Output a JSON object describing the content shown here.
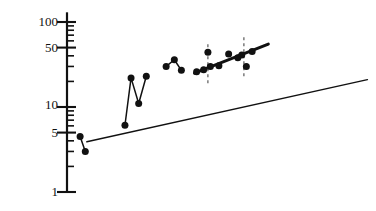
{
  "chart_data": {
    "type": "scatter",
    "title": "",
    "xlabel": "",
    "ylabel": "",
    "yscale": "log",
    "xscale": "linear",
    "grid": false,
    "legend": null,
    "ylim": [
      1,
      130
    ],
    "xlim": [
      0,
      1
    ],
    "y_ticks_major": [
      1,
      5,
      10,
      50,
      100
    ],
    "y_tick_labels": [
      "1",
      "5",
      "10",
      "50",
      "100"
    ],
    "y_ticks_minor": [
      2,
      3,
      4,
      6,
      7,
      8,
      9,
      20,
      30,
      40,
      60,
      70,
      80,
      90
    ],
    "x_axis_visible": false,
    "series": [
      {
        "name": "near-axis-pair",
        "style": "line-with-markers",
        "marker": "filled-circle",
        "points": [
          {
            "x": 0.043,
            "y": 4.5
          },
          {
            "x": 0.06,
            "y": 3.0
          }
        ]
      },
      {
        "name": "zigzag-series",
        "style": "line-with-markers",
        "marker": "filled-circle",
        "points": [
          {
            "x": 0.19,
            "y": 6.1
          },
          {
            "x": 0.21,
            "y": 22.0
          },
          {
            "x": 0.235,
            "y": 11.0
          },
          {
            "x": 0.26,
            "y": 23.0
          }
        ]
      },
      {
        "name": "peak-series",
        "style": "line-with-markers",
        "marker": "filled-circle",
        "points": [
          {
            "x": 0.325,
            "y": 30.0
          },
          {
            "x": 0.352,
            "y": 36.0
          },
          {
            "x": 0.375,
            "y": 27.0
          }
        ]
      },
      {
        "name": "main-cluster",
        "style": "markers-only",
        "marker": "filled-circle",
        "points": [
          {
            "x": 0.425,
            "y": 26.0
          },
          {
            "x": 0.448,
            "y": 27.5
          },
          {
            "x": 0.462,
            "y": 44.0
          },
          {
            "x": 0.47,
            "y": 30.0
          },
          {
            "x": 0.498,
            "y": 30.5
          },
          {
            "x": 0.53,
            "y": 42.0
          },
          {
            "x": 0.56,
            "y": 38.0
          },
          {
            "x": 0.573,
            "y": 41.0
          },
          {
            "x": 0.588,
            "y": 30.0
          },
          {
            "x": 0.607,
            "y": 45.0
          }
        ]
      }
    ],
    "error_bars": [
      {
        "x": 0.462,
        "y_low": 19.0,
        "y_high": 58.0,
        "style": "dashed-vertical"
      },
      {
        "x": 0.58,
        "y_low": 23.0,
        "y_high": 70.0,
        "style": "dashed-vertical"
      }
    ],
    "fit_lines": [
      {
        "name": "thick-trend-line",
        "style": "solid-thick",
        "width_px": 3,
        "x0": 0.418,
        "y0": 25.0,
        "x1": 0.66,
        "y1": 55.0
      },
      {
        "name": "thin-reference-line",
        "style": "solid-thin",
        "width_px": 1.4,
        "x0": 0.065,
        "y0": 3.9,
        "x1": 0.985,
        "y1": 21.0
      }
    ]
  },
  "axis": {
    "labels": [
      {
        "key": "tick-100",
        "text": "100"
      },
      {
        "key": "tick-50",
        "text": "50"
      },
      {
        "key": "tick-10",
        "text": "10"
      },
      {
        "key": "tick-5",
        "text": "5"
      },
      {
        "key": "tick-1",
        "text": "1"
      }
    ]
  }
}
